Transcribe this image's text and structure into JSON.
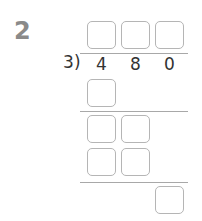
{
  "question": {
    "number": "2"
  },
  "division": {
    "divisor": "3",
    "paren": ")",
    "dividend_digits": [
      "4",
      "8",
      "0"
    ],
    "quotient_boxes": 3,
    "step_rows": [
      {
        "boxes": 1
      },
      {
        "boxes": 2
      },
      {
        "boxes": 2
      },
      {
        "boxes": 1
      }
    ]
  },
  "colors": {
    "box_border": "#b5b5b5",
    "line": "#a8a8a8",
    "question_number": "#8a8a8a"
  }
}
